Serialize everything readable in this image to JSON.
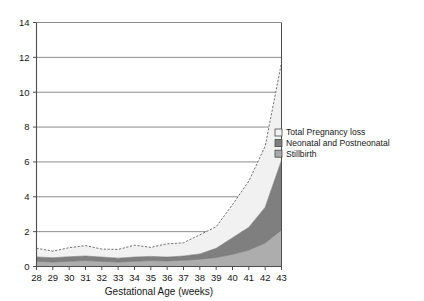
{
  "chart_data": {
    "type": "area",
    "stacked": true,
    "title": "",
    "subtitle": "",
    "xlabel": "Gestational Age (weeks)",
    "ylabel": "",
    "x": [
      28,
      29,
      30,
      31,
      32,
      33,
      34,
      35,
      36,
      37,
      38,
      39,
      40,
      41,
      42,
      43
    ],
    "categories": [
      "28",
      "29",
      "30",
      "31",
      "32",
      "33",
      "34",
      "35",
      "36",
      "37",
      "38",
      "39",
      "40",
      "41",
      "42",
      "43"
    ],
    "xlim": [
      28,
      43
    ],
    "ylim": [
      0,
      14
    ],
    "ytick_labels": [
      "0",
      "2",
      "4",
      "6",
      "8",
      "10",
      "12",
      "14"
    ],
    "ytick_values": [
      0,
      2,
      4,
      6,
      8,
      10,
      12,
      14
    ],
    "xtick_labels": [
      "28",
      "29",
      "30",
      "31",
      "32",
      "33",
      "34",
      "35",
      "36",
      "37",
      "38",
      "39",
      "40",
      "41",
      "42",
      "43"
    ],
    "grid": "horizontal",
    "legend_position": "right",
    "series": [
      {
        "name": "Stillbirth",
        "order": 1,
        "color": "#adadad",
        "values": [
          0.3,
          0.26,
          0.3,
          0.34,
          0.3,
          0.26,
          0.3,
          0.34,
          0.32,
          0.36,
          0.42,
          0.52,
          0.7,
          0.95,
          1.35,
          2.1
        ]
      },
      {
        "name": "Neonatal and Postneonatal",
        "order": 2,
        "color": "#7f7f7f",
        "values": [
          0.25,
          0.24,
          0.26,
          0.26,
          0.24,
          0.22,
          0.24,
          0.24,
          0.22,
          0.24,
          0.3,
          0.52,
          0.95,
          1.3,
          2.05,
          4.0
        ]
      },
      {
        "name": "Total Pregnancy loss",
        "order": 3,
        "color": "#f1f1f1",
        "values": [
          0.5,
          0.38,
          0.52,
          0.6,
          0.46,
          0.5,
          0.68,
          0.52,
          0.76,
          0.76,
          1.1,
          1.24,
          1.9,
          2.65,
          3.5,
          5.6
        ]
      }
    ],
    "cumulative_totals": [
      1.05,
      0.88,
      1.08,
      1.2,
      1.0,
      0.98,
      1.22,
      1.1,
      1.3,
      1.36,
      1.82,
      2.28,
      3.55,
      4.9,
      6.9,
      11.7
    ],
    "annotations": []
  },
  "legend": {
    "items": [
      {
        "label": "Total Pregnancy loss",
        "swatch": "#f2f2f2",
        "swatch_border": "#4a4a4a"
      },
      {
        "label": "Neonatal and Postneonatal",
        "swatch": "#7f7f7f",
        "swatch_border": "#4a4a4a"
      },
      {
        "label": "Stillbirth",
        "swatch": "#a8a8a8",
        "swatch_border": "#4a4a4a"
      }
    ]
  },
  "axes": {
    "x_title": "Gestational Age (weeks)",
    "y_title": ""
  },
  "colors": {
    "gridline": "#8d8d8d",
    "axis": "#4d4d4d",
    "dashed_outline": "#606060",
    "background": "#ffffff"
  }
}
